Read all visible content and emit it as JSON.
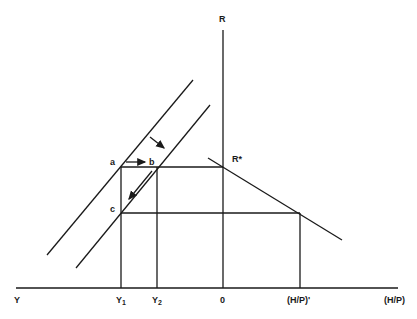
{
  "diagram": {
    "type": "economics-graph",
    "axes": {
      "vertical_label": "R",
      "horizontal_left_label": "Y",
      "horizontal_right_label": "(H/P)",
      "origin_label": "0"
    },
    "tick_labels": {
      "y1": "Y",
      "y1_sub": "1",
      "y2": "Y",
      "y2_sub": "2",
      "hp_prime": "(H/P)'"
    },
    "points": {
      "a": "a",
      "b": "b",
      "c": "c",
      "r_star": "R*"
    },
    "colors": {
      "ink": "#1a1a1a",
      "background": "#ffffff"
    }
  }
}
